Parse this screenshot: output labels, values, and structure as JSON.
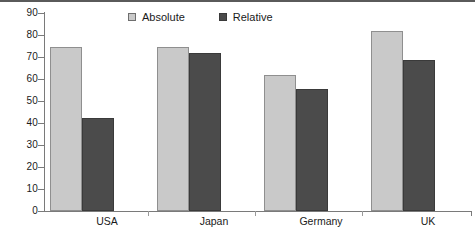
{
  "chart_data": {
    "type": "bar",
    "title": "",
    "xlabel": "",
    "ylabel": "",
    "categories": [
      "USA",
      "Japan",
      "Germany",
      "UK"
    ],
    "series": [
      {
        "name": "Absolute",
        "color": "#c9c9c9",
        "values": [
          74,
          74,
          61,
          81
        ]
      },
      {
        "name": "Relative",
        "color": "#4b4b4b",
        "values": [
          42,
          71,
          55,
          68
        ]
      }
    ],
    "ylim": [
      0,
      90
    ],
    "yticks": [
      0,
      10,
      20,
      30,
      40,
      50,
      60,
      70,
      80,
      90
    ],
    "ytick_labels": [
      "0",
      "10",
      "20",
      "30",
      "40",
      "50",
      "60",
      "70",
      "80",
      "90"
    ],
    "grid": false,
    "legend_position": "top-center",
    "legend": [
      "Absolute",
      "Relative"
    ]
  },
  "axis": {
    "y_labels": [
      "90",
      "80",
      "70",
      "60",
      "50",
      "40",
      "30",
      "20",
      "10",
      "0"
    ],
    "x_labels": [
      "USA",
      "Japan",
      "Germany",
      "UK"
    ]
  },
  "legend": {
    "items": [
      {
        "label": "Absolute",
        "swatch": "light-gray-square"
      },
      {
        "label": "Relative",
        "swatch": "dark-gray-square"
      }
    ]
  },
  "colors": {
    "absolute": "#c9c9c9",
    "relative": "#4b4b4b",
    "axis": "#7a7a7a",
    "rule": "#5a5a5a",
    "text": "#1a1a1a",
    "background": "#ffffff"
  }
}
